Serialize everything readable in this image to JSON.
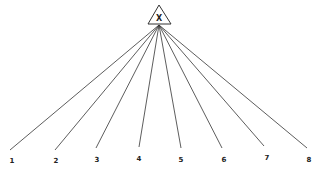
{
  "diagram": {
    "type": "tree",
    "root": {
      "label": "X",
      "shape": "triangle",
      "x": 159,
      "y": 15
    },
    "apex": {
      "x": 159,
      "y": 25
    },
    "leaves": [
      {
        "label": "1",
        "x": 10,
        "y": 150,
        "lx": 12,
        "ly": 163
      },
      {
        "label": "2",
        "x": 55,
        "y": 150,
        "lx": 56,
        "ly": 163
      },
      {
        "label": "3",
        "x": 96,
        "y": 148,
        "lx": 97,
        "ly": 162
      },
      {
        "label": "4",
        "x": 139,
        "y": 147,
        "lx": 139,
        "ly": 161
      },
      {
        "label": "5",
        "x": 181,
        "y": 148,
        "lx": 181,
        "ly": 162
      },
      {
        "label": "6",
        "x": 222,
        "y": 148,
        "lx": 224,
        "ly": 162
      },
      {
        "label": "7",
        "x": 264,
        "y": 146,
        "lx": 267,
        "ly": 160
      },
      {
        "label": "8",
        "x": 307,
        "y": 148,
        "lx": 309,
        "ly": 162
      }
    ],
    "colors": {
      "line": "#333333",
      "text": "#222222"
    }
  }
}
